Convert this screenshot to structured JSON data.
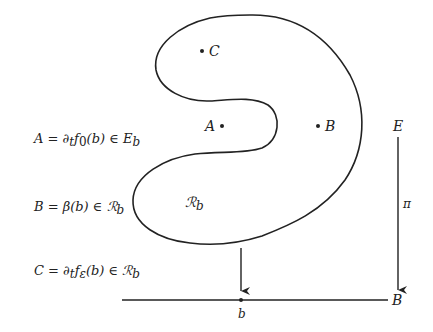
{
  "equations": [
    {
      "id": "A",
      "text": "A = ∂ₜf₀(b) ∈ E_b",
      "lhs": "A = ∂",
      "sub_t": "t",
      "f": "f",
      "sub_f": "0",
      "rest": "(b) ∈ E",
      "sub_end": "b"
    },
    {
      "id": "B",
      "text": "B = β(b) ∈ ℛ_b",
      "lhs": "B = β(b) ∈ ℛ",
      "sub_end": "b"
    },
    {
      "id": "C",
      "text": "C = ∂ₜf_ε(b) ∈ ℛ_b",
      "lhs": "C = ∂",
      "sub_t": "t",
      "f": "f",
      "sub_f": "ε",
      "rest": "(b) ∈ ℛ",
      "sub_end": "b"
    }
  ],
  "region": {
    "label": "ℛ",
    "sub": "b"
  },
  "points": [
    {
      "id": "C",
      "label": "C"
    },
    {
      "id": "A",
      "label": "A"
    },
    {
      "id": "B",
      "label": "B"
    }
  ],
  "fibration": {
    "total_space": "E",
    "projection": "π",
    "base_space": "B",
    "base_point": "b"
  },
  "colors": {
    "stroke": "#222222",
    "text": "#222222",
    "background": "#ffffff"
  }
}
